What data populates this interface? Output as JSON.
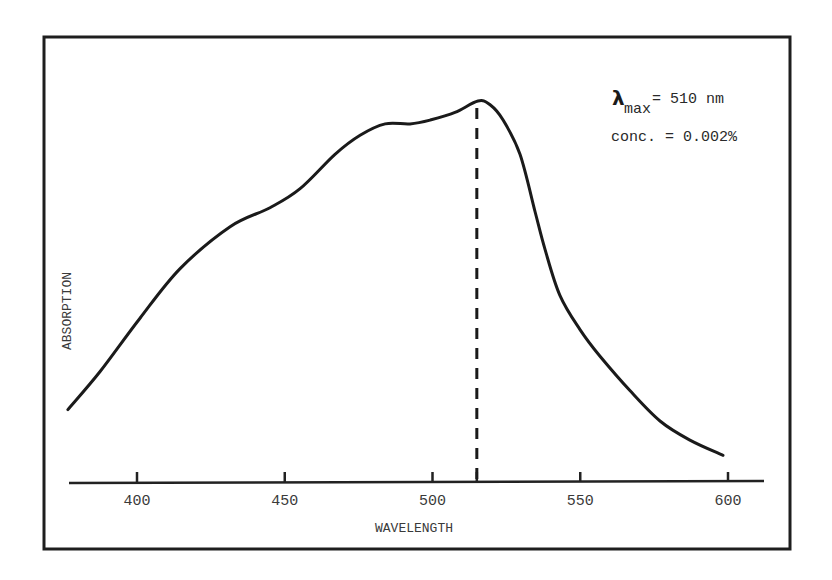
{
  "chart_data": {
    "type": "line",
    "title": "",
    "xlabel": "WAVELENGTH",
    "ylabel": "ABSORPTION",
    "xlim": [
      376,
      612
    ],
    "ylim": [
      0,
      1.05
    ],
    "grid": false,
    "legend": null,
    "x_ticks": [
      400,
      450,
      500,
      515,
      550,
      600
    ],
    "x_tick_labels": [
      "400",
      "450",
      "500",
      "",
      "550",
      "600"
    ],
    "y_ticks": [],
    "y_units_note": "relative absorption (no numeric scale shown)",
    "series": [
      {
        "name": "Absorption spectrum",
        "x": [
          376.6,
          387.5,
          401,
          414.6,
          431.5,
          445,
          455.2,
          467,
          475.5,
          484,
          492.4,
          499.2,
          507.6,
          515.4,
          519.5,
          523.9,
          529.6,
          534.7,
          538.1,
          543.1,
          549.9,
          556.7,
          566.8,
          577,
          587.1,
          598.3
        ],
        "y": [
          0.19,
          0.29,
          0.43,
          0.56,
          0.67,
          0.72,
          0.77,
          0.86,
          0.91,
          0.94,
          0.94,
          0.95,
          0.97,
          1.0,
          0.99,
          0.95,
          0.86,
          0.71,
          0.61,
          0.49,
          0.4,
          0.33,
          0.24,
          0.16,
          0.11,
          0.07
        ]
      }
    ],
    "reference_lines": [
      {
        "type": "vertical",
        "style": "dashed",
        "x": 515,
        "label": "lambda max"
      }
    ],
    "annotations": [
      {
        "text": "λmax = 510 nm",
        "position": "top-right"
      },
      {
        "text": "conc. = 0.002%",
        "position": "top-right"
      }
    ]
  },
  "annotations": {
    "lambda_symbol": "λ",
    "lambda_subscript": "max",
    "lambda_value": "= 510 nm",
    "concentration": "conc. = 0.002%"
  },
  "axes": {
    "x_label": "WAVELENGTH",
    "y_label": "ABSORPTION",
    "x_tick_labels": [
      "400",
      "450",
      "500",
      "550",
      "600"
    ]
  },
  "layout": {
    "px_per_nm": 2.955,
    "x_origin_nm": 400,
    "x_origin_px": 137,
    "y_zero_px": 482,
    "y_scale_px": 381
  }
}
